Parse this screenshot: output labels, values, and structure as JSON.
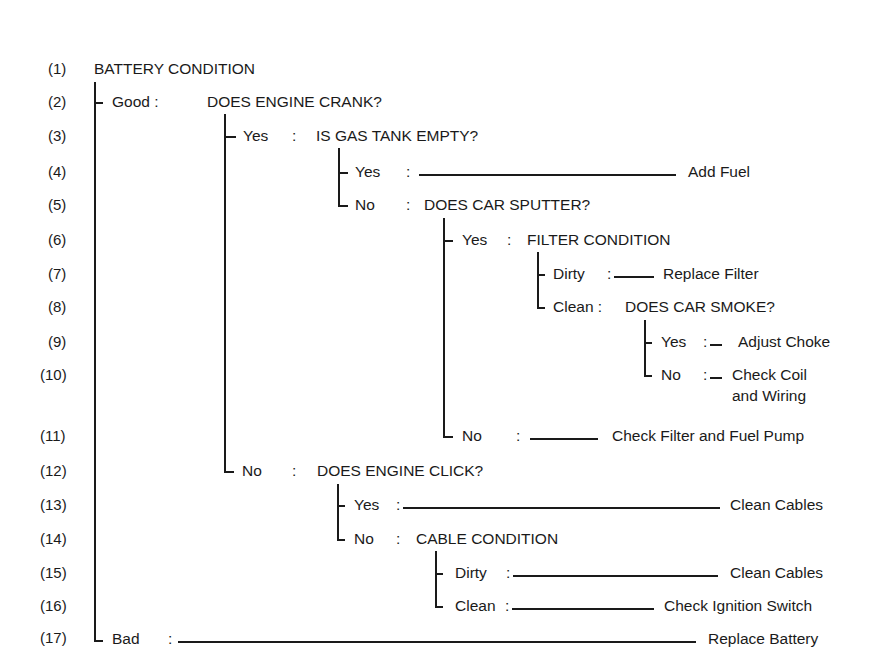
{
  "title": "BATTERY CONDITION",
  "row_numbers": [
    "(1)",
    "(2)",
    "(3)",
    "(4)",
    "(5)",
    "(6)",
    "(7)",
    "(8)",
    "(9)",
    "(10)",
    "(11)",
    "(12)",
    "(13)",
    "(14)",
    "(15)",
    "(16)",
    "(17)"
  ],
  "nodes": {
    "good": {
      "label": "Good :",
      "question": "DOES ENGINE CRANK?"
    },
    "crank_yes": {
      "label": "Yes",
      "sep": ":",
      "question": "IS GAS TANK EMPTY?"
    },
    "gas_yes": {
      "label": "Yes",
      "sep": ":",
      "action": "Add Fuel"
    },
    "gas_no": {
      "label": "No",
      "sep": ":",
      "question": "DOES CAR SPUTTER?"
    },
    "sputter_yes": {
      "label": "Yes",
      "sep": ":",
      "question": "FILTER CONDITION"
    },
    "filter_dirty": {
      "label": "Dirty",
      "sep": ":",
      "action": "Replace Filter"
    },
    "filter_clean": {
      "label": "Clean :",
      "question": "DOES CAR SMOKE?"
    },
    "smoke_yes": {
      "label": "Yes",
      "sep": ":",
      "action": "Adjust Choke"
    },
    "smoke_no": {
      "label": "No",
      "sep": ":",
      "action_line1": "Check Coil",
      "action_line2": "and Wiring"
    },
    "sputter_no": {
      "label": "No",
      "sep": ":",
      "action": "Check Filter and Fuel Pump"
    },
    "crank_no": {
      "label": "No",
      "sep": ":",
      "question": "DOES ENGINE CLICK?"
    },
    "click_yes": {
      "label": "Yes",
      "sep": ":",
      "action": "Clean Cables"
    },
    "click_no": {
      "label": "No",
      "sep": ":",
      "question": "CABLE CONDITION"
    },
    "cable_dirty": {
      "label": "Dirty",
      "sep": ":",
      "action": "Clean Cables"
    },
    "cable_clean": {
      "label": "Clean",
      "sep": ":",
      "action": "Check Ignition Switch"
    },
    "bad": {
      "label": "Bad",
      "sep": ":",
      "action": "Replace Battery"
    }
  }
}
